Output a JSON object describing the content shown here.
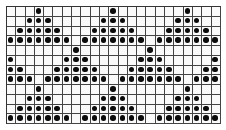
{
  "pattern": {
    "rows": 12,
    "cols": 23,
    "filled_symbol": "black-circle",
    "colors": {
      "line": "#444444",
      "dot": "#0b0b0b",
      "background": "#fafafa"
    },
    "grid": [
      "00010000000100000001000",
      "00111000001110000011100",
      "01111100011111000111110",
      "11111110111111101111111",
      "00000001000000010000000",
      "10000011100000111000001",
      "11000111110001111100011",
      "11101111111011111110111",
      "00010000000100000001000",
      "00111000001110000011100",
      "01111100011111000111110",
      "11111110111111101111111"
    ]
  }
}
